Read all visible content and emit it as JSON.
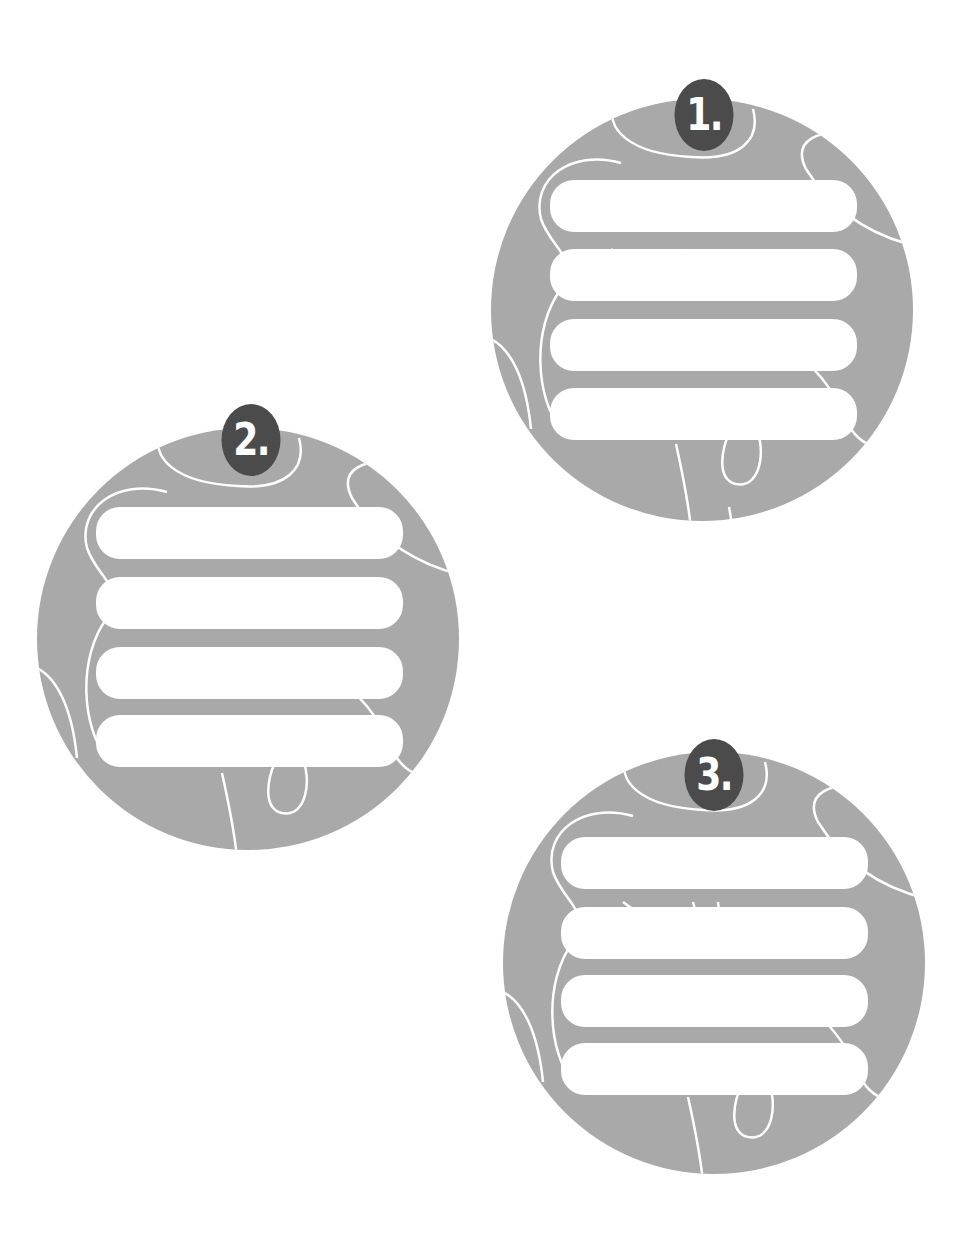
{
  "colors": {
    "background": "#ffffff",
    "disc_fill": "#a9a9a9",
    "badge_fill": "#4b4b4b",
    "bar_fill": "#ffffff",
    "line_color": "#ffffff"
  },
  "discs": [
    {
      "label": "1.",
      "left": 491,
      "top": 99,
      "bar_count": 4
    },
    {
      "label": "2.",
      "left": 37,
      "top": 428,
      "bar_count": 4
    },
    {
      "label": "3.",
      "left": 503,
      "top": 752,
      "bar_count": 4
    }
  ]
}
